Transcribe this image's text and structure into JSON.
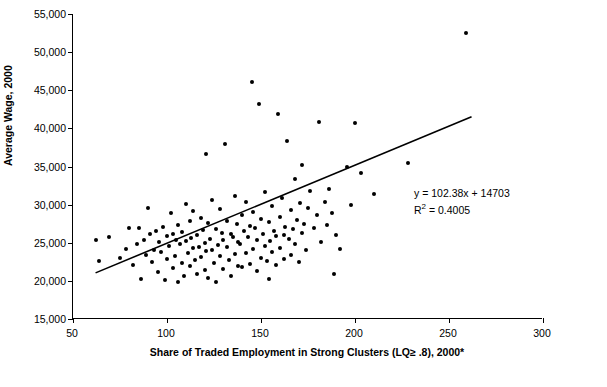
{
  "chart_data": {
    "type": "scatter",
    "title": "",
    "xlabel": "Share of Traded Employment in Strong Clusters (LQ≥ .8), 2000*",
    "ylabel": "Average Wage, 2000",
    "xlim": [
      50,
      300
    ],
    "ylim": [
      15000,
      55000
    ],
    "xticks": [
      50,
      100,
      150,
      200,
      250,
      300
    ],
    "xticklabels": [
      "50",
      "100",
      "150",
      "200",
      "250",
      "300"
    ],
    "yticks": [
      15000,
      20000,
      25000,
      30000,
      35000,
      40000,
      45000,
      50000,
      55000
    ],
    "yticklabels": [
      "15,000",
      "20,000",
      "25,000",
      "30,000",
      "35,000",
      "40,000",
      "45,000",
      "50,000",
      "55,000"
    ],
    "grid": false,
    "legend": "none",
    "annotations": {
      "equation": "y = 102.38x + 14703",
      "r_squared_label": "R",
      "r_squared_sup": "2",
      "r_squared_value": " = 0.4005"
    },
    "trendline": {
      "slope": 102.38,
      "intercept": 14703,
      "x_start": 62,
      "x_end": 262
    },
    "points": [
      [
        62,
        25400
      ],
      [
        64,
        22600
      ],
      [
        69,
        25700
      ],
      [
        75,
        23000
      ],
      [
        78,
        24200
      ],
      [
        80,
        26900
      ],
      [
        82,
        22100
      ],
      [
        84,
        24900
      ],
      [
        85,
        27000
      ],
      [
        86,
        20300
      ],
      [
        88,
        25300
      ],
      [
        89,
        23400
      ],
      [
        90,
        29600
      ],
      [
        91,
        26200
      ],
      [
        92,
        22500
      ],
      [
        93,
        24100
      ],
      [
        94,
        26600
      ],
      [
        95,
        21200
      ],
      [
        96,
        25100
      ],
      [
        97,
        23800
      ],
      [
        98,
        27100
      ],
      [
        99,
        20100
      ],
      [
        100,
        25900
      ],
      [
        100,
        22900
      ],
      [
        101,
        24600
      ],
      [
        102,
        28900
      ],
      [
        103,
        26100
      ],
      [
        103,
        21700
      ],
      [
        104,
        23300
      ],
      [
        105,
        25400
      ],
      [
        106,
        19900
      ],
      [
        106,
        27300
      ],
      [
        107,
        24800
      ],
      [
        108,
        22300
      ],
      [
        108,
        26400
      ],
      [
        109,
        20600
      ],
      [
        110,
        25200
      ],
      [
        110,
        30100
      ],
      [
        111,
        23700
      ],
      [
        112,
        27800
      ],
      [
        112,
        21900
      ],
      [
        113,
        25600
      ],
      [
        114,
        24300
      ],
      [
        114,
        29100
      ],
      [
        115,
        22700
      ],
      [
        116,
        26000
      ],
      [
        116,
        20900
      ],
      [
        117,
        24500
      ],
      [
        118,
        28300
      ],
      [
        118,
        23100
      ],
      [
        119,
        26700
      ],
      [
        120,
        21400
      ],
      [
        120,
        25000
      ],
      [
        121,
        36600
      ],
      [
        121,
        23900
      ],
      [
        122,
        27600
      ],
      [
        122,
        20400
      ],
      [
        123,
        25500
      ],
      [
        124,
        24000
      ],
      [
        124,
        30600
      ],
      [
        125,
        22400
      ],
      [
        126,
        26800
      ],
      [
        126,
        19800
      ],
      [
        127,
        24700
      ],
      [
        128,
        29400
      ],
      [
        128,
        23200
      ],
      [
        129,
        26300
      ],
      [
        130,
        21600
      ],
      [
        130,
        25300
      ],
      [
        131,
        38000
      ],
      [
        132,
        24400
      ],
      [
        132,
        27900
      ],
      [
        133,
        22800
      ],
      [
        134,
        26100
      ],
      [
        134,
        20700
      ],
      [
        135,
        25800
      ],
      [
        136,
        31100
      ],
      [
        136,
        23500
      ],
      [
        137,
        27400
      ],
      [
        138,
        22000
      ],
      [
        138,
        25100
      ],
      [
        139,
        24900
      ],
      [
        140,
        28700
      ],
      [
        140,
        21800
      ],
      [
        141,
        26500
      ],
      [
        142,
        23600
      ],
      [
        142,
        30300
      ],
      [
        143,
        25700
      ],
      [
        144,
        22200
      ],
      [
        144,
        27200
      ],
      [
        145,
        46100
      ],
      [
        146,
        24200
      ],
      [
        146,
        29000
      ],
      [
        147,
        26900
      ],
      [
        148,
        21300
      ],
      [
        148,
        25400
      ],
      [
        149,
        43200
      ],
      [
        150,
        28100
      ],
      [
        150,
        23000
      ],
      [
        151,
        26200
      ],
      [
        152,
        24600
      ],
      [
        152,
        31600
      ],
      [
        153,
        22600
      ],
      [
        154,
        27700
      ],
      [
        154,
        20200
      ],
      [
        155,
        25200
      ],
      [
        156,
        29800
      ],
      [
        156,
        23800
      ],
      [
        157,
        26600
      ],
      [
        158,
        22100
      ],
      [
        158,
        25900
      ],
      [
        159,
        41900
      ],
      [
        160,
        28400
      ],
      [
        160,
        24300
      ],
      [
        161,
        30900
      ],
      [
        162,
        26000
      ],
      [
        162,
        22900
      ],
      [
        163,
        27100
      ],
      [
        164,
        38400
      ],
      [
        165,
        25500
      ],
      [
        166,
        29300
      ],
      [
        166,
        23400
      ],
      [
        167,
        26800
      ],
      [
        168,
        33400
      ],
      [
        168,
        24800
      ],
      [
        169,
        28000
      ],
      [
        170,
        22500
      ],
      [
        171,
        30200
      ],
      [
        172,
        26300
      ],
      [
        172,
        35200
      ],
      [
        173,
        27500
      ],
      [
        174,
        24000
      ],
      [
        175,
        29600
      ],
      [
        176,
        31800
      ],
      [
        178,
        26900
      ],
      [
        180,
        28600
      ],
      [
        181,
        40800
      ],
      [
        182,
        25100
      ],
      [
        184,
        30400
      ],
      [
        185,
        27300
      ],
      [
        186,
        32100
      ],
      [
        188,
        28900
      ],
      [
        189,
        20900
      ],
      [
        190,
        26000
      ],
      [
        192,
        24200
      ],
      [
        196,
        34900
      ],
      [
        198,
        29900
      ],
      [
        200,
        40700
      ],
      [
        203,
        34100
      ],
      [
        210,
        31400
      ],
      [
        228,
        35500
      ],
      [
        259,
        52500
      ]
    ]
  }
}
